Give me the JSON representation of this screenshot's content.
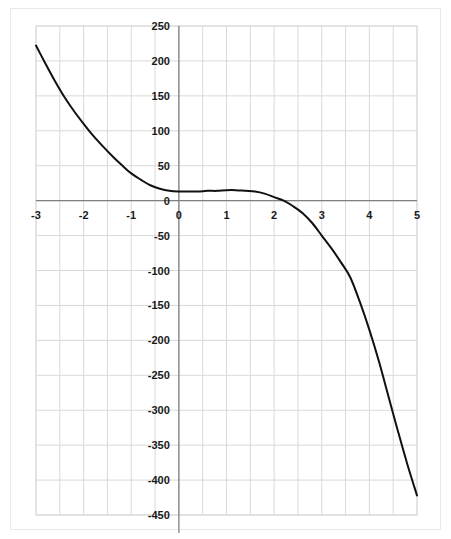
{
  "chart_data": {
    "type": "line",
    "title": "",
    "subtitle": "",
    "xlabel": "",
    "ylabel": "",
    "xlim": [
      -3,
      5
    ],
    "ylim": [
      -450,
      250
    ],
    "grid": true,
    "legend": null,
    "x_ticks": [
      "-3",
      "-2",
      "-1",
      "0",
      "1",
      "2",
      "3",
      "4",
      "5"
    ],
    "x_tick_values": [
      -3,
      -2,
      -1,
      0,
      1,
      2,
      3,
      4,
      5
    ],
    "y_ticks": [
      "250",
      "200",
      "150",
      "100",
      "50",
      "0",
      "-50",
      "-100",
      "-150",
      "-200",
      "-250",
      "-300",
      "-350",
      "-400",
      "-450"
    ],
    "y_tick_values": [
      250,
      200,
      150,
      100,
      50,
      0,
      -50,
      -100,
      -150,
      -200,
      -250,
      -300,
      -350,
      -400,
      -450
    ],
    "x_minor_step": 0.5,
    "y_minor_step": 50,
    "series": [
      {
        "name": "curve",
        "color": "#111111",
        "line_width": 2,
        "x": [
          -3.0,
          -2.8,
          -2.6,
          -2.4,
          -2.2,
          -2.0,
          -1.8,
          -1.6,
          -1.4,
          -1.2,
          -1.0,
          -0.8,
          -0.6,
          -0.4,
          -0.2,
          0.0,
          0.2,
          0.4,
          0.6,
          0.8,
          1.0,
          1.2,
          1.4,
          1.6,
          1.8,
          2.0,
          2.2,
          2.4,
          2.6,
          2.8,
          3.0,
          3.2,
          3.4,
          3.6,
          3.8,
          4.0,
          4.2,
          4.4,
          4.6,
          4.8,
          5.0
        ],
        "y": [
          222,
          196,
          171,
          148,
          128,
          110,
          93,
          78,
          64,
          51,
          39,
          30,
          22,
          17,
          14,
          13,
          13,
          13,
          14,
          14,
          15,
          15,
          14,
          13,
          10,
          5,
          0,
          -8,
          -18,
          -32,
          -50,
          -68,
          -88,
          -110,
          -145,
          -185,
          -230,
          -280,
          -330,
          -378,
          -422
        ]
      }
    ],
    "axis_lines": {
      "x_axis_at": 0,
      "y_axis_at": 0,
      "color": "#808080"
    },
    "zero_label": "0"
  },
  "frame": {
    "border_color": "#e9e9e9",
    "plot_border_color": "#d9d9d9",
    "grid_color": "#d9d9d9",
    "background": "#ffffff"
  }
}
